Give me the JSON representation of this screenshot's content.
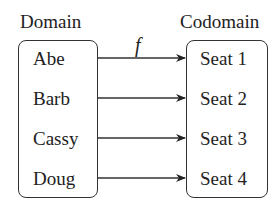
{
  "diagram": {
    "domain": {
      "title": "Domain",
      "items": [
        "Abe",
        "Barb",
        "Cassy",
        "Doug"
      ]
    },
    "codomain": {
      "title": "Codomain",
      "items": [
        "Seat 1",
        "Seat 2",
        "Seat 3",
        "Seat 4"
      ]
    },
    "function_label": "f",
    "mappings": [
      {
        "from": "Abe",
        "to": "Seat 1"
      },
      {
        "from": "Barb",
        "to": "Seat 2"
      },
      {
        "from": "Cassy",
        "to": "Seat 3"
      },
      {
        "from": "Doug",
        "to": "Seat 4"
      }
    ],
    "colors": {
      "stroke": "#333333",
      "text": "#222222",
      "background": "#ffffff"
    }
  }
}
